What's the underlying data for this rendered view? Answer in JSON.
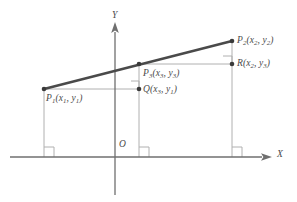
{
  "figure": {
    "colors": {
      "segment": "#4a4a4a",
      "axis": "#6f6f6f",
      "construction": "#b0b0b0",
      "text": "#4a4a4a",
      "background": "#ffffff"
    },
    "axes": {
      "x_label": "X",
      "y_label": "Y",
      "origin_label": "O"
    },
    "points": [
      {
        "id": "p1",
        "label_main": "P",
        "label_sub": "1",
        "coords_open": "(",
        "cx": "x",
        "cx_sub": "1",
        "comma": ", ",
        "cy": "y",
        "cy_sub": "1",
        "coords_close": ")"
      },
      {
        "id": "p2",
        "label_main": "P",
        "label_sub": "2",
        "coords_open": "(",
        "cx": "x",
        "cx_sub": "2",
        "comma": ", ",
        "cy": "y",
        "cy_sub": "2",
        "coords_close": ")"
      },
      {
        "id": "p3",
        "label_main": "P",
        "label_sub": "3",
        "coords_open": "(",
        "cx": "x",
        "cx_sub": "3",
        "comma": ", ",
        "cy": "y",
        "cy_sub": "3",
        "coords_close": ")"
      },
      {
        "id": "q",
        "label_main": "Q",
        "label_sub": "",
        "coords_open": "(",
        "cx": "x",
        "cx_sub": "3",
        "comma": ", ",
        "cy": "y",
        "cy_sub": "1",
        "coords_close": ")"
      },
      {
        "id": "r",
        "label_main": "R",
        "label_sub": "",
        "coords_open": "(",
        "cx": "x",
        "cx_sub": "2",
        "comma": ", ",
        "cy": "y",
        "cy_sub": "3",
        "coords_close": ")"
      }
    ]
  }
}
